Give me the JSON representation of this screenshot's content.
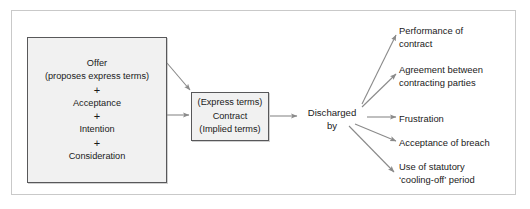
{
  "diagram": {
    "type": "flow-diagram",
    "title_visible": false,
    "colors": {
      "box_fill": "#f1f1f1",
      "box_border": "#58585a",
      "outer_frame": "#c9c9c9",
      "arrow": "#808080",
      "text": "#1a1a1a",
      "background": "#ffffff"
    },
    "formation_box": {
      "name": "contract-formation-elements",
      "lines": [
        "Offer",
        "(proposes express terms)",
        "+",
        "Acceptance",
        "+",
        "Intention",
        "+",
        "Consideration"
      ]
    },
    "contract_box": {
      "name": "contract",
      "lines": [
        "(Express terms)",
        "Contract",
        "(Implied terms)"
      ]
    },
    "discharge_label": {
      "line1": "Discharged",
      "line2": "by"
    },
    "outcomes": [
      {
        "line1": "Performance of",
        "line2": "contract"
      },
      {
        "line1": "Agreement between",
        "line2": "contracting parties"
      },
      {
        "line1": "Frustration",
        "line2": ""
      },
      {
        "line1": "Acceptance of breach",
        "line2": ""
      },
      {
        "line1": "Use of statutory",
        "line2": "‘cooling-off’ period"
      }
    ],
    "arrows": [
      {
        "name": "arrow-formation-to-contract-diagonal",
        "from": "formation-box",
        "to": "contract-box"
      },
      {
        "name": "arrow-formation-to-contract-straight",
        "from": "formation-box",
        "to": "contract-box"
      },
      {
        "name": "arrow-contract-to-discharged",
        "from": "contract-box",
        "to": "discharged-by"
      },
      {
        "name": "arrow-discharged-to-performance",
        "from": "discharged-by",
        "to": "outcome-0"
      },
      {
        "name": "arrow-discharged-to-agreement",
        "from": "discharged-by",
        "to": "outcome-1"
      },
      {
        "name": "arrow-discharged-to-frustration",
        "from": "discharged-by",
        "to": "outcome-2"
      },
      {
        "name": "arrow-discharged-to-acceptance-of-breach",
        "from": "discharged-by",
        "to": "outcome-3"
      },
      {
        "name": "arrow-discharged-to-cooling-off",
        "from": "discharged-by",
        "to": "outcome-4"
      }
    ]
  }
}
